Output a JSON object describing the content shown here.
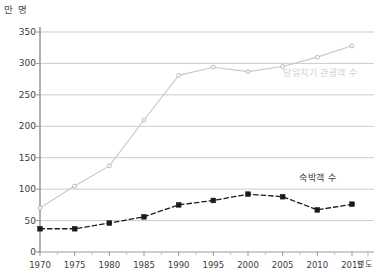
{
  "chart_data": {
    "type": "line",
    "title": "",
    "subtitle": "",
    "xlabel": "년도",
    "ylabel": "만 명",
    "x": [
      1970,
      1975,
      1980,
      1985,
      1990,
      1995,
      2000,
      2005,
      2010,
      2015
    ],
    "xticks": [
      "1970",
      "1975",
      "1980",
      "1985",
      "1990",
      "1995",
      "2000",
      "2005",
      "2010",
      "2015"
    ],
    "yticks": [
      "0",
      "50",
      "100",
      "150",
      "200",
      "250",
      "300",
      "350"
    ],
    "ytick_values": [
      0,
      50,
      100,
      150,
      200,
      250,
      300,
      350
    ],
    "ylim": [
      0,
      350
    ],
    "grid": true,
    "legend_position": "inline-right",
    "series": [
      {
        "name": "당일치기 관광객 수",
        "color": "#c8c8c8",
        "style": "solid",
        "marker": "open-circle",
        "values": [
          70,
          105,
          137,
          210,
          281,
          294,
          287,
          295,
          310,
          328
        ]
      },
      {
        "name": "숙박객 수",
        "color": "#1a1a1a",
        "style": "dashed",
        "marker": "square",
        "values": [
          37,
          37,
          46,
          56,
          75,
          82,
          92,
          88,
          67,
          76
        ]
      }
    ]
  },
  "axis": {
    "y_unit_label": "만 명",
    "x_unit_label": "년도"
  }
}
